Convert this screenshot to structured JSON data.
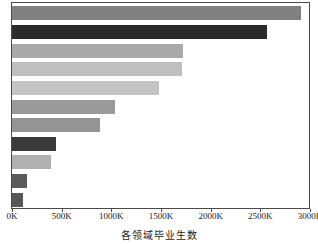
{
  "chart_data": {
    "type": "bar",
    "orientation": "horizontal",
    "title": "",
    "xlabel": "各领域毕业生数",
    "ylabel": "",
    "xlim": [
      0,
      3000
    ],
    "xunit": "K",
    "grid": false,
    "legend": null,
    "categories": [
      "bar-1",
      "bar-2",
      "bar-3",
      "bar-4",
      "bar-5",
      "bar-6",
      "bar-7",
      "bar-8",
      "bar-9",
      "bar-10",
      "bar-11"
    ],
    "values": [
      2910,
      2570,
      1725,
      1715,
      1480,
      1040,
      890,
      440,
      390,
      155,
      115
    ],
    "bar_colors": [
      "#808080",
      "#2b2b2b",
      "#a9a9a9",
      "#bfbfbf",
      "#c4c4c4",
      "#9a9a9a",
      "#949494",
      "#3a3a3a",
      "#b0b0b0",
      "#5a5a5a",
      "#585858"
    ],
    "x_ticks": [
      0,
      500,
      1000,
      1500,
      2000,
      2500,
      3000
    ],
    "x_tick_labels": [
      "0K",
      "500K",
      "1000K",
      "1500K",
      "2000K",
      "2500K",
      "3000K"
    ]
  },
  "axes": {
    "frame_color": "#4a4a4a",
    "background": "#ffffff"
  }
}
